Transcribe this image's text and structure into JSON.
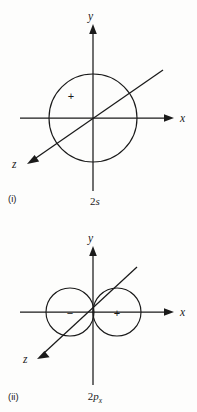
{
  "figure": {
    "background_color": "#fdfdfc",
    "ink_color": "#1a1a1a",
    "width": 197,
    "height": 412
  },
  "panels": [
    {
      "id": "panel-2s",
      "index_label": "(i)",
      "orbital_label_prefix": "2",
      "orbital_label_symbol": "s",
      "orbital_label_subscript": "",
      "orbital_label_full": "2s",
      "axes": [
        {
          "name": "y",
          "label": "y",
          "direction": "up"
        },
        {
          "name": "x",
          "label": "x",
          "direction": "right"
        },
        {
          "name": "z",
          "label": "z",
          "direction": "down-left"
        }
      ],
      "origin": {
        "x": 93,
        "y": 118
      },
      "lobes": [
        {
          "name": "sphere",
          "sign": "+",
          "center_x": 93,
          "center_y": 118,
          "radius": 44,
          "sign_x": 71,
          "sign_y": 96
        }
      ]
    },
    {
      "id": "panel-2px",
      "index_label": "(ii)",
      "orbital_label_prefix": "2",
      "orbital_label_symbol": "p",
      "orbital_label_subscript": "x",
      "orbital_label_full": "2px",
      "axes": [
        {
          "name": "y",
          "label": "y",
          "direction": "up"
        },
        {
          "name": "x",
          "label": "x",
          "direction": "right"
        },
        {
          "name": "z",
          "label": "z",
          "direction": "down-left"
        }
      ],
      "origin": {
        "x": 93,
        "y": 312
      },
      "lobes": [
        {
          "name": "negative-lobe",
          "sign": "−",
          "center_x": 70,
          "center_y": 312,
          "radius": 24,
          "sign_x": 70,
          "sign_y": 316
        },
        {
          "name": "positive-lobe",
          "sign": "+",
          "center_x": 117,
          "center_y": 312,
          "radius": 24,
          "sign_x": 117,
          "sign_y": 316
        }
      ]
    }
  ]
}
